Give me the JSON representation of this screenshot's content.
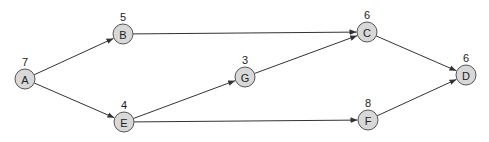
{
  "diagram": {
    "type": "directed-graph",
    "colors": {
      "node_fill": "#d8d8d8",
      "node_stroke": "#555555",
      "edge": "#333333",
      "text": "#222222"
    },
    "node_radius": 10,
    "nodes": [
      {
        "id": "A",
        "label": "A",
        "weight": "7",
        "x": 25,
        "y": 79
      },
      {
        "id": "B",
        "label": "B",
        "weight": "5",
        "x": 123,
        "y": 34
      },
      {
        "id": "E",
        "label": "E",
        "weight": "4",
        "x": 124,
        "y": 122
      },
      {
        "id": "G",
        "label": "G",
        "weight": "3",
        "x": 245,
        "y": 77
      },
      {
        "id": "C",
        "label": "C",
        "weight": "6",
        "x": 367,
        "y": 32
      },
      {
        "id": "F",
        "label": "F",
        "weight": "8",
        "x": 368,
        "y": 120
      },
      {
        "id": "D",
        "label": "D",
        "weight": "6",
        "x": 466,
        "y": 75
      }
    ],
    "edges": [
      {
        "from": "A",
        "to": "B"
      },
      {
        "from": "A",
        "to": "E"
      },
      {
        "from": "B",
        "to": "C"
      },
      {
        "from": "E",
        "to": "G"
      },
      {
        "from": "E",
        "to": "F"
      },
      {
        "from": "G",
        "to": "C"
      },
      {
        "from": "C",
        "to": "D"
      },
      {
        "from": "F",
        "to": "D"
      }
    ]
  }
}
